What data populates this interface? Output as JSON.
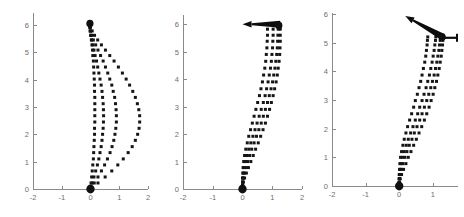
{
  "figure": {
    "title": "",
    "background_color": "#ffffff",
    "panel_count": 3,
    "dot_color": "#151515",
    "axis_color": "#8a8a8a",
    "tick_label_color": "#6e6e6e",
    "arrow_color": "#0d0d0d"
  },
  "chart_data": [
    {
      "type": "scatter",
      "panel_index": 1,
      "panel_name": "panel-left",
      "title": "",
      "xlabel": "",
      "ylabel": "",
      "xlim": [
        -2,
        2
      ],
      "ylim": [
        0,
        6.4
      ],
      "grid": false,
      "legend": "none",
      "xticks": [
        -2,
        -1,
        0,
        1,
        2
      ],
      "xtick_labels": [
        "-2",
        "-1",
        "0",
        "1",
        "2"
      ],
      "yticks": [
        0,
        1,
        2,
        3,
        4,
        5,
        6
      ],
      "ytick_labels": [
        "0",
        "1",
        "2",
        "3",
        "4",
        "5",
        "6"
      ],
      "marker": "square-dot",
      "origin_marker": {
        "x": 0.0,
        "y": 0.0,
        "label": "start-blob"
      },
      "end_marker": {
        "x": -0.02,
        "y": 6.05,
        "label": "end-blob"
      },
      "series": [
        {
          "name": "trajectory-1",
          "x": [
            0.0,
            0.02,
            0.04,
            0.06,
            0.08,
            0.1,
            0.11,
            0.12,
            0.13,
            0.14,
            0.14,
            0.15,
            0.15,
            0.15,
            0.15,
            0.15,
            0.14,
            0.14,
            0.13,
            0.12,
            0.11,
            0.1,
            0.08,
            0.07,
            0.05,
            0.03,
            0.01,
            -0.01,
            -0.02,
            -0.03
          ],
          "y": [
            0.0,
            0.22,
            0.44,
            0.66,
            0.88,
            1.1,
            1.33,
            1.55,
            1.78,
            2.0,
            2.22,
            2.45,
            2.68,
            2.9,
            3.12,
            3.35,
            3.57,
            3.8,
            4.02,
            4.24,
            4.46,
            4.68,
            4.88,
            5.08,
            5.27,
            5.45,
            5.62,
            5.78,
            5.92,
            6.03
          ]
        },
        {
          "name": "trajectory-2",
          "x": [
            0.0,
            0.06,
            0.12,
            0.18,
            0.24,
            0.29,
            0.33,
            0.37,
            0.4,
            0.42,
            0.44,
            0.45,
            0.455,
            0.45,
            0.44,
            0.42,
            0.4,
            0.37,
            0.33,
            0.29,
            0.25,
            0.21,
            0.16,
            0.12,
            0.08,
            0.04,
            0.01,
            -0.01,
            -0.02,
            -0.03
          ],
          "y": [
            0.0,
            0.22,
            0.44,
            0.66,
            0.88,
            1.1,
            1.33,
            1.55,
            1.78,
            2.0,
            2.22,
            2.45,
            2.68,
            2.9,
            3.12,
            3.35,
            3.57,
            3.8,
            4.02,
            4.24,
            4.46,
            4.68,
            4.88,
            5.08,
            5.27,
            5.45,
            5.62,
            5.78,
            5.92,
            6.03
          ]
        },
        {
          "name": "trajectory-3",
          "x": [
            0.0,
            0.13,
            0.26,
            0.38,
            0.49,
            0.59,
            0.68,
            0.75,
            0.81,
            0.85,
            0.88,
            0.9,
            0.9,
            0.89,
            0.87,
            0.84,
            0.79,
            0.74,
            0.67,
            0.6,
            0.52,
            0.44,
            0.35,
            0.26,
            0.18,
            0.1,
            0.04,
            0.0,
            -0.02,
            -0.03
          ],
          "y": [
            0.0,
            0.22,
            0.44,
            0.66,
            0.88,
            1.1,
            1.33,
            1.55,
            1.78,
            2.0,
            2.22,
            2.45,
            2.68,
            2.9,
            3.12,
            3.35,
            3.57,
            3.8,
            4.02,
            4.24,
            4.46,
            4.68,
            4.88,
            5.08,
            5.27,
            5.45,
            5.62,
            5.78,
            5.92,
            6.03
          ]
        },
        {
          "name": "trajectory-4",
          "x": [
            0.0,
            0.26,
            0.51,
            0.74,
            0.95,
            1.14,
            1.31,
            1.45,
            1.56,
            1.64,
            1.69,
            1.71,
            1.71,
            1.68,
            1.63,
            1.56,
            1.47,
            1.36,
            1.24,
            1.11,
            0.97,
            0.82,
            0.67,
            0.52,
            0.38,
            0.25,
            0.14,
            0.06,
            0.0,
            -0.03
          ],
          "y": [
            0.0,
            0.22,
            0.44,
            0.66,
            0.88,
            1.1,
            1.33,
            1.55,
            1.78,
            2.0,
            2.22,
            2.45,
            2.68,
            2.9,
            3.12,
            3.35,
            3.57,
            3.8,
            4.02,
            4.24,
            4.46,
            4.68,
            4.88,
            5.08,
            5.27,
            5.45,
            5.62,
            5.78,
            5.92,
            6.03
          ]
        }
      ],
      "annotations": [
        {
          "name": "tip-marker",
          "type": "blob",
          "x": -0.02,
          "y": 6.05
        }
      ]
    },
    {
      "type": "scatter",
      "panel_index": 2,
      "panel_name": "panel-middle",
      "title": "",
      "xlabel": "",
      "ylabel": "",
      "xlim": [
        -2,
        2
      ],
      "ylim": [
        0,
        6.3
      ],
      "grid": false,
      "legend": "none",
      "xticks": [
        -2,
        -1,
        0,
        1,
        2
      ],
      "xtick_labels": [
        "-2",
        "-1",
        "0",
        "1",
        "2"
      ],
      "yticks": [
        0,
        1,
        2,
        3,
        4,
        5,
        6
      ],
      "ytick_labels": [
        "0",
        "1",
        "2",
        "3",
        "4",
        "5",
        "6"
      ],
      "marker": "square-dot",
      "origin_marker": {
        "x": 0.0,
        "y": 0.0,
        "label": "start-blob"
      },
      "series": [
        {
          "name": "trajectory-1",
          "x": [
            0.0,
            0.0,
            0.0,
            0.0,
            0.01,
            0.02,
            0.04,
            0.07,
            0.11,
            0.16,
            0.21,
            0.27,
            0.33,
            0.39,
            0.45,
            0.51,
            0.57,
            0.62,
            0.67,
            0.71,
            0.75,
            0.78,
            0.8,
            0.82,
            0.83,
            0.84,
            0.84,
            0.84
          ],
          "y": [
            0.0,
            0.12,
            0.25,
            0.4,
            0.58,
            0.78,
            1.0,
            1.22,
            1.45,
            1.68,
            1.92,
            2.16,
            2.4,
            2.65,
            2.9,
            3.15,
            3.4,
            3.65,
            3.9,
            4.15,
            4.4,
            4.65,
            4.9,
            5.14,
            5.38,
            5.6,
            5.82,
            6.0
          ]
        },
        {
          "name": "trajectory-2",
          "x": [
            0.0,
            0.0,
            0.0,
            0.01,
            0.03,
            0.06,
            0.1,
            0.15,
            0.21,
            0.28,
            0.35,
            0.42,
            0.49,
            0.56,
            0.63,
            0.7,
            0.76,
            0.81,
            0.86,
            0.9,
            0.94,
            0.97,
            0.99,
            1.01,
            1.02,
            1.03,
            1.03,
            1.03
          ],
          "y": [
            0.0,
            0.12,
            0.25,
            0.4,
            0.58,
            0.78,
            1.0,
            1.22,
            1.45,
            1.68,
            1.92,
            2.16,
            2.4,
            2.65,
            2.9,
            3.15,
            3.4,
            3.65,
            3.9,
            4.15,
            4.4,
            4.65,
            4.9,
            5.14,
            5.38,
            5.6,
            5.82,
            6.0
          ]
        },
        {
          "name": "trajectory-3",
          "x": [
            0.0,
            0.0,
            0.01,
            0.03,
            0.06,
            0.11,
            0.17,
            0.24,
            0.31,
            0.39,
            0.47,
            0.55,
            0.63,
            0.7,
            0.77,
            0.84,
            0.9,
            0.96,
            1.01,
            1.05,
            1.09,
            1.12,
            1.15,
            1.17,
            1.18,
            1.19,
            1.2,
            1.2
          ],
          "y": [
            0.0,
            0.12,
            0.25,
            0.4,
            0.58,
            0.78,
            1.0,
            1.22,
            1.45,
            1.68,
            1.92,
            2.16,
            2.4,
            2.65,
            2.9,
            3.15,
            3.4,
            3.65,
            3.9,
            4.15,
            4.4,
            4.65,
            4.9,
            5.14,
            5.38,
            5.6,
            5.82,
            6.0
          ]
        },
        {
          "name": "trajectory-4",
          "x": [
            0.0,
            0.01,
            0.03,
            0.07,
            0.13,
            0.2,
            0.28,
            0.36,
            0.44,
            0.53,
            0.61,
            0.69,
            0.77,
            0.84,
            0.91,
            0.97,
            1.03,
            1.08,
            1.13,
            1.17,
            1.2,
            1.23,
            1.25,
            1.26,
            1.27,
            1.27,
            1.27,
            1.27
          ],
          "y": [
            0.0,
            0.12,
            0.25,
            0.4,
            0.58,
            0.78,
            1.0,
            1.22,
            1.45,
            1.68,
            1.92,
            2.16,
            2.4,
            2.65,
            2.9,
            3.15,
            3.4,
            3.65,
            3.9,
            4.15,
            4.4,
            4.65,
            4.9,
            5.14,
            5.38,
            5.6,
            5.82,
            6.0
          ]
        }
      ],
      "annotations": [
        {
          "name": "horizontal-arrow",
          "type": "arrow",
          "tail_x": 1.27,
          "tail_y": 6.0,
          "head_x": 0.0,
          "head_y": 6.0,
          "direction": "left"
        },
        {
          "name": "tip-blob",
          "type": "blob",
          "x": 1.22,
          "y": 5.95
        }
      ]
    },
    {
      "type": "scatter",
      "panel_index": 3,
      "panel_name": "panel-right",
      "title": "",
      "xlabel": "",
      "ylabel": "",
      "xlim": [
        -2,
        1.75
      ],
      "ylim": [
        0,
        6.0
      ],
      "grid": false,
      "legend": "none",
      "xticks": [
        -2,
        -1,
        0,
        1
      ],
      "xtick_labels": [
        "-2",
        "-1",
        "0",
        "1"
      ],
      "yticks": [
        0,
        1,
        2,
        3,
        4,
        5,
        6
      ],
      "ytick_labels": [
        "0",
        "1",
        "2",
        "3",
        "4",
        "5",
        "6"
      ],
      "marker": "square-dot",
      "origin_marker": {
        "x": 0.0,
        "y": 0.0,
        "label": "start-blob"
      },
      "series": [
        {
          "name": "trajectory-1",
          "x": [
            0.0,
            0.0,
            0.0,
            0.0,
            0.01,
            0.02,
            0.04,
            0.07,
            0.11,
            0.15,
            0.2,
            0.25,
            0.31,
            0.37,
            0.43,
            0.48,
            0.54,
            0.59,
            0.64,
            0.68,
            0.72,
            0.76,
            0.79,
            0.81,
            0.83,
            0.84,
            0.85
          ],
          "y": [
            0.0,
            0.12,
            0.25,
            0.4,
            0.58,
            0.78,
            1.0,
            1.2,
            1.42,
            1.63,
            1.85,
            2.07,
            2.3,
            2.52,
            2.75,
            2.98,
            3.2,
            3.43,
            3.65,
            3.87,
            4.1,
            4.32,
            4.53,
            4.73,
            4.92,
            5.08,
            5.2
          ]
        },
        {
          "name": "trajectory-2",
          "x": [
            0.0,
            0.0,
            0.0,
            0.01,
            0.03,
            0.06,
            0.1,
            0.15,
            0.21,
            0.27,
            0.34,
            0.41,
            0.48,
            0.55,
            0.61,
            0.68,
            0.74,
            0.8,
            0.85,
            0.9,
            0.94,
            0.98,
            1.01,
            1.04,
            1.06,
            1.08,
            1.09
          ],
          "y": [
            0.0,
            0.12,
            0.25,
            0.4,
            0.58,
            0.78,
            1.0,
            1.2,
            1.42,
            1.63,
            1.85,
            2.07,
            2.3,
            2.52,
            2.75,
            2.98,
            3.2,
            3.43,
            3.65,
            3.87,
            4.1,
            4.32,
            4.53,
            4.73,
            4.92,
            5.08,
            5.2
          ]
        },
        {
          "name": "trajectory-3",
          "x": [
            0.0,
            0.0,
            0.01,
            0.03,
            0.06,
            0.11,
            0.17,
            0.23,
            0.3,
            0.38,
            0.45,
            0.53,
            0.61,
            0.68,
            0.75,
            0.82,
            0.88,
            0.94,
            0.99,
            1.04,
            1.08,
            1.12,
            1.15,
            1.18,
            1.2,
            1.22,
            1.23
          ],
          "y": [
            0.0,
            0.12,
            0.25,
            0.4,
            0.58,
            0.78,
            1.0,
            1.2,
            1.42,
            1.63,
            1.85,
            2.07,
            2.3,
            2.52,
            2.75,
            2.98,
            3.2,
            3.43,
            3.65,
            3.87,
            4.1,
            4.32,
            4.53,
            4.73,
            4.92,
            5.08,
            5.2
          ]
        },
        {
          "name": "trajectory-4",
          "x": [
            0.0,
            0.01,
            0.03,
            0.07,
            0.13,
            0.2,
            0.27,
            0.35,
            0.43,
            0.51,
            0.59,
            0.67,
            0.75,
            0.82,
            0.89,
            0.95,
            1.01,
            1.06,
            1.11,
            1.15,
            1.19,
            1.22,
            1.25,
            1.27,
            1.29,
            1.3,
            1.31
          ],
          "y": [
            0.0,
            0.12,
            0.25,
            0.4,
            0.58,
            0.78,
            1.0,
            1.2,
            1.42,
            1.63,
            1.85,
            2.07,
            2.3,
            2.52,
            2.75,
            2.98,
            3.2,
            3.43,
            3.65,
            3.87,
            4.1,
            4.32,
            4.53,
            4.73,
            4.92,
            5.08,
            5.2
          ]
        }
      ],
      "annotations": [
        {
          "name": "diagonal-arrow",
          "type": "arrow",
          "tail_x": 1.3,
          "tail_y": 5.2,
          "head_x": 0.18,
          "head_y": 5.93,
          "direction": "up-left"
        },
        {
          "name": "pivot-bar",
          "type": "segment",
          "x1": 1.24,
          "y1": 5.17,
          "x2": 1.72,
          "y2": 5.17
        },
        {
          "name": "pivot-blob",
          "type": "blob",
          "x": 1.28,
          "y": 5.2
        }
      ]
    }
  ]
}
